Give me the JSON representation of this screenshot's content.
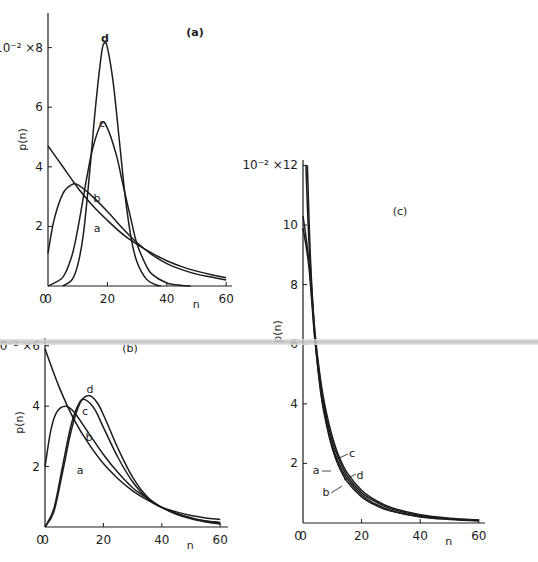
{
  "chart_data": [
    {
      "id": "a",
      "type": "line",
      "panel_label": "(a)",
      "title": "",
      "xlabel": "n",
      "ylabel": "p(n)",
      "y_scale_prefix": "10⁻² ×",
      "xlim": [
        0,
        60
      ],
      "ylim": [
        0,
        9.2
      ],
      "xticks": [
        0,
        20,
        40,
        60
      ],
      "yticks": [
        2,
        4,
        6,
        8
      ],
      "grid": false,
      "legend": "inline curve labels",
      "series": [
        {
          "name": "a",
          "x": [
            0,
            5,
            10,
            15,
            20,
            25,
            30,
            35,
            40,
            45,
            50,
            55,
            60
          ],
          "values": [
            4.7,
            4.0,
            3.3,
            2.7,
            2.2,
            1.75,
            1.4,
            1.1,
            0.85,
            0.65,
            0.5,
            0.38,
            0.28
          ]
        },
        {
          "name": "b",
          "x": [
            0,
            2,
            5,
            8,
            10,
            15,
            20,
            25,
            30,
            35,
            40,
            45,
            50,
            55,
            60
          ],
          "values": [
            1.1,
            2.2,
            3.1,
            3.4,
            3.4,
            3.0,
            2.5,
            1.95,
            1.45,
            1.05,
            0.75,
            0.55,
            0.4,
            0.3,
            0.2
          ]
        },
        {
          "name": "c",
          "x": [
            0,
            5,
            8,
            10,
            13,
            15,
            18,
            20,
            23,
            25,
            28,
            30,
            33,
            35,
            40,
            45,
            48
          ],
          "values": [
            0,
            0.3,
            1.0,
            1.9,
            3.6,
            4.6,
            5.45,
            5.3,
            4.4,
            3.5,
            2.2,
            1.4,
            0.7,
            0.4,
            0.1,
            0.02,
            0
          ]
        },
        {
          "name": "d",
          "x": [
            5,
            8,
            10,
            12,
            14,
            16,
            18,
            19,
            20,
            22,
            24,
            26,
            28,
            30,
            33,
            36,
            38
          ],
          "values": [
            0,
            0.2,
            0.7,
            1.8,
            3.8,
            6.0,
            7.8,
            8.15,
            8.0,
            6.8,
            4.9,
            3.0,
            1.6,
            0.8,
            0.25,
            0.05,
            0
          ]
        }
      ]
    },
    {
      "id": "b",
      "type": "line",
      "panel_label": "(b)",
      "title": "",
      "xlabel": "n",
      "ylabel": "p(n)",
      "y_scale_prefix": "10⁻² ×",
      "xlim": [
        0,
        60
      ],
      "ylim": [
        0,
        6.2
      ],
      "xticks": [
        0,
        20,
        40,
        60
      ],
      "yticks": [
        2,
        4,
        6
      ],
      "grid": false,
      "legend": "inline curve labels",
      "series": [
        {
          "name": "a",
          "x": [
            0,
            5,
            10,
            15,
            20,
            25,
            30,
            35,
            40,
            45,
            50,
            55,
            60
          ],
          "values": [
            5.9,
            4.6,
            3.55,
            2.75,
            2.1,
            1.6,
            1.2,
            0.9,
            0.65,
            0.5,
            0.38,
            0.3,
            0.25
          ]
        },
        {
          "name": "b",
          "x": [
            0,
            2,
            4,
            7,
            10,
            15,
            20,
            25,
            30,
            35,
            40,
            45,
            50,
            55,
            60
          ],
          "values": [
            2.0,
            3.2,
            3.8,
            4.0,
            3.8,
            3.1,
            2.4,
            1.8,
            1.3,
            0.95,
            0.65,
            0.45,
            0.3,
            0.2,
            0.15
          ]
        },
        {
          "name": "c",
          "x": [
            0,
            3,
            6,
            9,
            12,
            14,
            17,
            20,
            25,
            30,
            35,
            40,
            45,
            50,
            55,
            60
          ],
          "values": [
            0,
            0.6,
            2.0,
            3.4,
            4.15,
            4.2,
            3.9,
            3.3,
            2.3,
            1.5,
            0.95,
            0.65,
            0.45,
            0.3,
            0.2,
            0.13
          ]
        },
        {
          "name": "d",
          "x": [
            0,
            3,
            6,
            9,
            12,
            15,
            18,
            21,
            25,
            30,
            35,
            40,
            45,
            50,
            55,
            60
          ],
          "values": [
            0,
            0.5,
            1.8,
            3.2,
            4.1,
            4.35,
            4.1,
            3.5,
            2.6,
            1.65,
            1.0,
            0.65,
            0.42,
            0.27,
            0.17,
            0.1
          ]
        }
      ]
    },
    {
      "id": "c",
      "type": "line",
      "panel_label": "(c)",
      "title": "",
      "xlabel": "n",
      "ylabel": "p(n)",
      "y_scale_prefix": "10⁻² ×",
      "xlim": [
        0,
        60
      ],
      "ylim": [
        0,
        12.4
      ],
      "xticks": [
        0,
        20,
        40,
        60
      ],
      "yticks": [
        2,
        4,
        6,
        8,
        10,
        12
      ],
      "grid": false,
      "legend": "inline curve labels with leader lines",
      "series": [
        {
          "name": "a",
          "x": [
            0,
            2,
            4,
            6,
            8,
            10,
            12,
            15,
            20,
            25,
            30,
            40,
            50,
            60
          ],
          "values": [
            9.9,
            8.6,
            6.2,
            4.5,
            3.4,
            2.6,
            2.05,
            1.5,
            0.95,
            0.62,
            0.42,
            0.22,
            0.13,
            0.08
          ]
        },
        {
          "name": "b",
          "x": [
            0,
            2,
            4,
            6,
            8,
            10,
            12,
            15,
            20,
            25,
            30,
            40,
            50,
            60
          ],
          "values": [
            10.3,
            8.8,
            6.3,
            4.4,
            3.3,
            2.5,
            1.95,
            1.4,
            0.88,
            0.58,
            0.4,
            0.2,
            0.12,
            0.07
          ]
        },
        {
          "name": "c",
          "x": [
            1,
            2,
            4,
            6,
            8,
            10,
            12,
            15,
            20,
            25,
            30,
            40,
            50,
            60
          ],
          "values": [
            12.0,
            9.5,
            6.5,
            4.8,
            3.7,
            2.9,
            2.3,
            1.7,
            1.1,
            0.75,
            0.52,
            0.28,
            0.16,
            0.1
          ]
        },
        {
          "name": "d",
          "x": [
            1.5,
            2.5,
            4,
            6,
            8,
            10,
            12,
            15,
            20,
            25,
            30,
            40,
            50,
            60
          ],
          "values": [
            12.0,
            9.0,
            6.4,
            4.7,
            3.55,
            2.75,
            2.2,
            1.6,
            1.02,
            0.7,
            0.48,
            0.25,
            0.14,
            0.09
          ]
        }
      ]
    }
  ],
  "layout": {
    "panels": {
      "a": {
        "x0": 48,
        "y0": 286,
        "px_per_x": 2.97,
        "px_per_y": 29.8,
        "axis_top": 13,
        "axis_right": 232
      },
      "b": {
        "x0": 45,
        "y0": 527,
        "px_per_x": 2.92,
        "px_per_y": 30.2,
        "axis_top": 338,
        "axis_right": 228
      },
      "c": {
        "x0": 303,
        "y0": 523,
        "px_per_x": 2.93,
        "px_per_y": 29.8,
        "axis_top": 160,
        "axis_right": 485
      }
    },
    "curve_labels": {
      "a": [
        {
          "t": "d",
          "x": 105,
          "y": 42
        },
        {
          "t": "c",
          "x": 102,
          "y": 127
        },
        {
          "t": "b",
          "x": 97,
          "y": 202
        },
        {
          "t": "a",
          "x": 97,
          "y": 232
        }
      ],
      "b": [
        {
          "t": "d",
          "x": 90,
          "y": 393
        },
        {
          "t": "c",
          "x": 85,
          "y": 415
        },
        {
          "t": "b",
          "x": 89,
          "y": 441
        },
        {
          "t": "a",
          "x": 80,
          "y": 474
        }
      ],
      "c": [
        {
          "t": "c",
          "x": 352,
          "y": 457,
          "lx1": 337,
          "ly1": 459,
          "lx2": 348,
          "ly2": 454
        },
        {
          "t": "a",
          "x": 316,
          "y": 474,
          "lx1": 322,
          "ly1": 471,
          "lx2": 331,
          "ly2": 471
        },
        {
          "t": "d",
          "x": 360,
          "y": 479,
          "lx1": 344,
          "ly1": 480,
          "lx2": 356,
          "ly2": 474
        },
        {
          "t": "b",
          "x": 326,
          "y": 496,
          "lx1": 331,
          "ly1": 493,
          "lx2": 342,
          "ly2": 486
        }
      ]
    }
  }
}
